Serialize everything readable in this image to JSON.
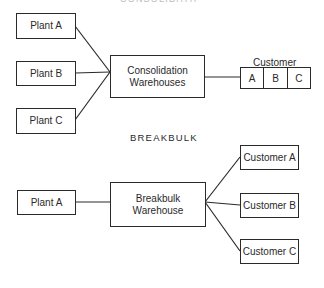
{
  "consolidation": {
    "section_title_partial": "CONSOLIDATION",
    "plants": [
      {
        "label": "Plant A"
      },
      {
        "label": "Plant B"
      },
      {
        "label": "Plant C"
      }
    ],
    "warehouse": {
      "line1": "Consolidation",
      "line2": "Warehouses"
    },
    "customer_group": {
      "title": "Customer",
      "cells": [
        "A",
        "B",
        "C"
      ]
    }
  },
  "breakbulk": {
    "section_title": "BREAKBULK",
    "plant": {
      "label": "Plant A"
    },
    "warehouse": {
      "line1": "Breakbulk",
      "line2": "Warehouse"
    },
    "customers": [
      {
        "label": "Customer A"
      },
      {
        "label": "Customer B"
      },
      {
        "label": "Customer C"
      }
    ]
  },
  "colors": {
    "line": "#2a2a2a",
    "background": "#ffffff"
  }
}
